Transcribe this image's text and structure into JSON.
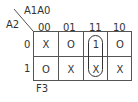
{
  "kmap": {
    "row_variable": "A2",
    "col_variable": "A1A0",
    "title": "F3",
    "col_labels": [
      "00",
      "01",
      "11",
      "10"
    ],
    "row_labels": [
      "0",
      "1"
    ],
    "cells": [
      [
        "X",
        "O",
        "1",
        "O"
      ],
      [
        "O",
        "X",
        "X",
        "X"
      ]
    ],
    "grouping": {
      "column": "11",
      "rows": [
        "0",
        "1"
      ]
    }
  }
}
